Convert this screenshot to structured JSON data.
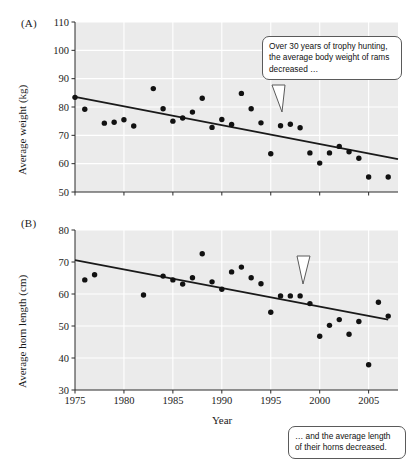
{
  "figure": {
    "background": "#ffffff",
    "plot_bg": "#ebebeb",
    "grid_color": "#ffffff",
    "point_color": "#111111",
    "trend_color": "#1a1a1a"
  },
  "panels": {
    "a": {
      "label": "(A)",
      "callout_text": "Over 30 years of trophy hunting, the average body weight of rams decreased …"
    },
    "b": {
      "label": "(B)",
      "callout_text": "… and the average length of their horns decreased."
    }
  },
  "chart_data": [
    {
      "type": "scatter",
      "panel": "(A)",
      "title": "",
      "xlabel": "",
      "ylabel": "Average weight (kg)",
      "xlim": [
        1975,
        2008
      ],
      "ylim": [
        50,
        110
      ],
      "xticks": [
        1975,
        1980,
        1985,
        1990,
        1995,
        2000,
        2005
      ],
      "yticks": [
        50,
        60,
        70,
        80,
        90,
        100,
        110
      ],
      "xticklabels": [
        "1975",
        "1980",
        "1985",
        "1990",
        "1995",
        "2000",
        "2005"
      ],
      "yticklabels": [
        "50",
        "60",
        "70",
        "80",
        "90",
        "100",
        "110"
      ],
      "grid": true,
      "legend": null,
      "x": [
        1975,
        1976,
        1978,
        1979,
        1980,
        1981,
        1983,
        1984,
        1985,
        1986,
        1987,
        1988,
        1989,
        1990,
        1991,
        1992,
        1993,
        1994,
        1995,
        1996,
        1997,
        1998,
        1999,
        2000,
        2001,
        2002,
        2003,
        2004,
        2005,
        2007
      ],
      "y": [
        83.4,
        79.2,
        74.3,
        74.6,
        75.5,
        73.3,
        86.5,
        79.4,
        75.0,
        76.1,
        78.2,
        83.1,
        72.8,
        75.6,
        73.8,
        84.8,
        79.4,
        74.4,
        63.5,
        73.4,
        73.9,
        72.7,
        63.8,
        60.2,
        63.8,
        66.1,
        64.2,
        61.9,
        55.3,
        55.3
      ],
      "trendline": {
        "x": [
          1975,
          2008
        ],
        "y": [
          83.6,
          61.6
        ]
      },
      "annotations": [
        {
          "text": "Over 30 years of trophy hunting, the average body weight of rams decreased …",
          "x": 1999,
          "y": 103
        }
      ]
    },
    {
      "type": "scatter",
      "panel": "(B)",
      "title": "",
      "xlabel": "Year",
      "ylabel": "Average horn length (cm)",
      "xlim": [
        1975,
        2008
      ],
      "ylim": [
        30,
        80
      ],
      "xticks": [
        1975,
        1980,
        1985,
        1990,
        1995,
        2000,
        2005
      ],
      "yticks": [
        30,
        40,
        50,
        60,
        70,
        80
      ],
      "xticklabels": [
        "1975",
        "1980",
        "1985",
        "1990",
        "1995",
        "2000",
        "2005"
      ],
      "yticklabels": [
        "30",
        "40",
        "50",
        "60",
        "70",
        "80"
      ],
      "grid": true,
      "legend": null,
      "x": [
        1976,
        1977,
        1982,
        1984,
        1985,
        1986,
        1987,
        1988,
        1989,
        1990,
        1991,
        1992,
        1993,
        1994,
        1995,
        1996,
        1997,
        1998,
        1999,
        2000,
        2001,
        2002,
        2003,
        2004,
        2005,
        2006,
        2007
      ],
      "y": [
        64.4,
        66.0,
        59.7,
        65.6,
        64.4,
        63.1,
        65.1,
        72.6,
        63.8,
        61.5,
        66.9,
        68.4,
        65.1,
        63.2,
        54.3,
        59.4,
        59.4,
        59.4,
        57.0,
        46.8,
        50.2,
        52.0,
        47.4,
        51.4,
        37.9,
        57.4,
        53.1
      ],
      "trendline": {
        "x": [
          1975,
          2007
        ],
        "y": [
          70.6,
          52.0
        ]
      },
      "annotations": [
        {
          "text": "… and the average length of their horns decreased.",
          "x": 2002,
          "y": 76
        }
      ]
    }
  ]
}
